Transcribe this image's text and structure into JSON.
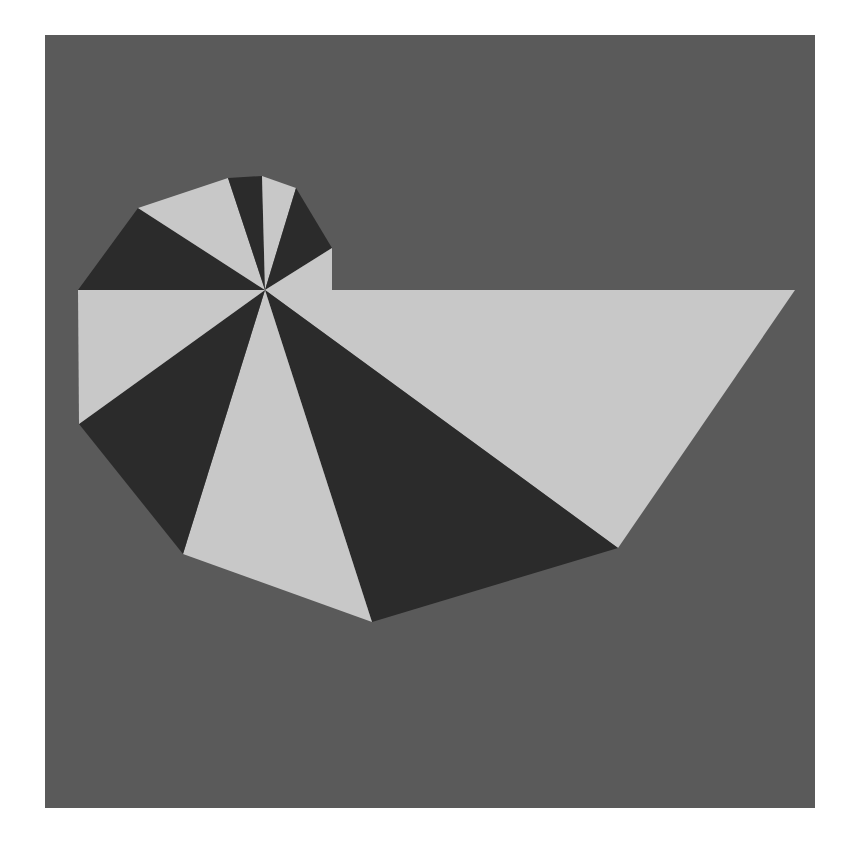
{
  "figure": {
    "title": "",
    "page_background": "#ffffff",
    "canvas_background": "#5a5a5a",
    "canvas_rect": {
      "x": 45,
      "y": 35,
      "width": 770,
      "height": 773
    }
  },
  "chart_data": {
    "type": "pie",
    "title": "",
    "subtitle": "",
    "xlabel": "",
    "ylabel": "",
    "grid": false,
    "legend": "none",
    "center": {
      "x": 265,
      "y": 290
    },
    "colors": {
      "light": "#c8c8c8",
      "dark": "#2b2b2b",
      "background": "#5a5a5a"
    },
    "rim_vertices": [
      {
        "index": 0,
        "x": 795,
        "y": 290,
        "label": "far-right"
      },
      {
        "index": 1,
        "x": 618,
        "y": 548,
        "label": "lower-right"
      },
      {
        "index": 2,
        "x": 372,
        "y": 622,
        "label": "bottom"
      },
      {
        "index": 3,
        "x": 183,
        "y": 554,
        "label": "lower-left"
      },
      {
        "index": 4,
        "x": 79,
        "y": 424,
        "label": "left-lower"
      },
      {
        "index": 5,
        "x": 78,
        "y": 290,
        "label": "left"
      },
      {
        "index": 6,
        "x": 138,
        "y": 208,
        "label": "upper-left"
      },
      {
        "index": 7,
        "x": 228,
        "y": 178,
        "label": "top-left"
      },
      {
        "index": 8,
        "x": 262,
        "y": 176,
        "label": "top"
      },
      {
        "index": 9,
        "x": 296,
        "y": 188,
        "label": "top-right"
      },
      {
        "index": 10,
        "x": 332,
        "y": 248,
        "label": "right-upper"
      },
      {
        "index": 11,
        "x": 332,
        "y": 290,
        "label": "right-lower"
      }
    ],
    "sectors": [
      {
        "id": 1,
        "from_vertex": 0,
        "to_vertex": 1,
        "fill": "light",
        "radius_px": 530,
        "angle_deg": 55.6
      },
      {
        "id": 2,
        "from_vertex": 1,
        "to_vertex": 2,
        "fill": "dark",
        "radius_px": 434,
        "angle_deg": 39.0
      },
      {
        "id": 3,
        "from_vertex": 2,
        "to_vertex": 3,
        "fill": "light",
        "radius_px": 345,
        "angle_deg": 34.5
      },
      {
        "id": 4,
        "from_vertex": 3,
        "to_vertex": 4,
        "fill": "dark",
        "radius_px": 288,
        "angle_deg": 26.0
      },
      {
        "id": 5,
        "from_vertex": 4,
        "to_vertex": 5,
        "fill": "light",
        "radius_px": 230,
        "angle_deg": 36.0
      },
      {
        "id": 6,
        "from_vertex": 5,
        "to_vertex": 6,
        "fill": "dark",
        "radius_px": 187,
        "angle_deg": 33.9
      },
      {
        "id": 7,
        "from_vertex": 6,
        "to_vertex": 7,
        "fill": "light",
        "radius_px": 153,
        "angle_deg": 26.5
      },
      {
        "id": 8,
        "from_vertex": 7,
        "to_vertex": 8,
        "fill": "dark",
        "radius_px": 117,
        "angle_deg": 9.7
      },
      {
        "id": 9,
        "from_vertex": 8,
        "to_vertex": 9,
        "fill": "light",
        "radius_px": 117,
        "angle_deg": 14.2
      },
      {
        "id": 10,
        "from_vertex": 9,
        "to_vertex": 10,
        "fill": "dark",
        "radius_px": 113,
        "angle_deg": 28.2
      },
      {
        "id": 11,
        "from_vertex": 10,
        "to_vertex": 11,
        "fill": "light",
        "radius_px": 80,
        "angle_deg": 30.6
      },
      {
        "id": 12,
        "from_vertex": 11,
        "to_vertex": 0,
        "fill": "dark",
        "radius_px": 67,
        "angle_deg": 0.0
      }
    ],
    "sector_count": 12
  }
}
